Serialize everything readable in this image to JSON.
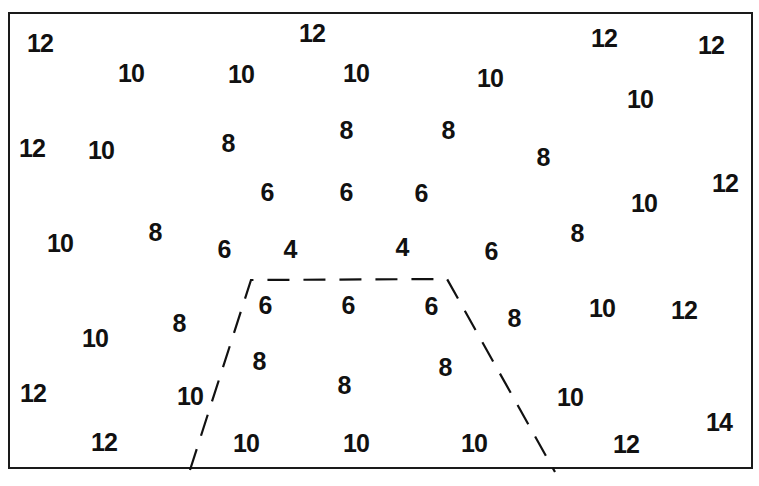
{
  "diagram": {
    "type": "contour-values-map",
    "frame": {
      "x": 8,
      "y": 12,
      "width": 745,
      "height": 457
    },
    "boundary": {
      "style": "dashed",
      "shape": "trapezoid",
      "points": [
        [
          190,
          470
        ],
        [
          251,
          280
        ],
        [
          447,
          279
        ],
        [
          555,
          472
        ]
      ]
    },
    "labels": [
      {
        "value": "12",
        "x": 40,
        "y": 43
      },
      {
        "value": "12",
        "x": 312,
        "y": 33
      },
      {
        "value": "12",
        "x": 604,
        "y": 38
      },
      {
        "value": "12",
        "x": 711,
        "y": 45
      },
      {
        "value": "10",
        "x": 131,
        "y": 73
      },
      {
        "value": "10",
        "x": 241,
        "y": 74
      },
      {
        "value": "10",
        "x": 356,
        "y": 73
      },
      {
        "value": "10",
        "x": 490,
        "y": 78
      },
      {
        "value": "10",
        "x": 640,
        "y": 99
      },
      {
        "value": "12",
        "x": 32,
        "y": 148
      },
      {
        "value": "10",
        "x": 101,
        "y": 150
      },
      {
        "value": "8",
        "x": 228,
        "y": 143
      },
      {
        "value": "8",
        "x": 346,
        "y": 130
      },
      {
        "value": "8",
        "x": 448,
        "y": 130
      },
      {
        "value": "8",
        "x": 543,
        "y": 157
      },
      {
        "value": "6",
        "x": 267,
        "y": 192
      },
      {
        "value": "6",
        "x": 346,
        "y": 192
      },
      {
        "value": "6",
        "x": 421,
        "y": 193
      },
      {
        "value": "10",
        "x": 644,
        "y": 203
      },
      {
        "value": "12",
        "x": 725,
        "y": 183
      },
      {
        "value": "10",
        "x": 60,
        "y": 243
      },
      {
        "value": "8",
        "x": 155,
        "y": 232
      },
      {
        "value": "6",
        "x": 224,
        "y": 249
      },
      {
        "value": "4",
        "x": 290,
        "y": 249
      },
      {
        "value": "4",
        "x": 402,
        "y": 247
      },
      {
        "value": "6",
        "x": 491,
        "y": 251
      },
      {
        "value": "8",
        "x": 577,
        "y": 233
      },
      {
        "value": "6",
        "x": 265,
        "y": 305
      },
      {
        "value": "6",
        "x": 348,
        "y": 305
      },
      {
        "value": "6",
        "x": 431,
        "y": 306
      },
      {
        "value": "8",
        "x": 514,
        "y": 318
      },
      {
        "value": "10",
        "x": 602,
        "y": 308
      },
      {
        "value": "12",
        "x": 684,
        "y": 310
      },
      {
        "value": "10",
        "x": 95,
        "y": 338
      },
      {
        "value": "8",
        "x": 179,
        "y": 323
      },
      {
        "value": "8",
        "x": 259,
        "y": 361
      },
      {
        "value": "8",
        "x": 445,
        "y": 367
      },
      {
        "value": "8",
        "x": 344,
        "y": 385
      },
      {
        "value": "12",
        "x": 33,
        "y": 393
      },
      {
        "value": "10",
        "x": 190,
        "y": 396
      },
      {
        "value": "10",
        "x": 570,
        "y": 397
      },
      {
        "value": "14",
        "x": 719,
        "y": 422
      },
      {
        "value": "12",
        "x": 104,
        "y": 442
      },
      {
        "value": "10",
        "x": 246,
        "y": 443
      },
      {
        "value": "10",
        "x": 356,
        "y": 443
      },
      {
        "value": "10",
        "x": 474,
        "y": 443
      },
      {
        "value": "12",
        "x": 626,
        "y": 444
      }
    ]
  }
}
